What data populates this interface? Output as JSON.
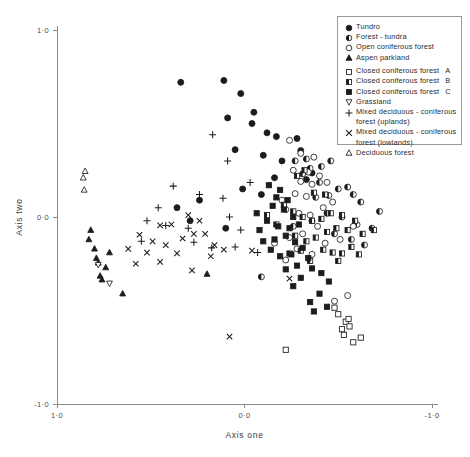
{
  "chart_data": {
    "type": "scatter",
    "title": "",
    "xlabel": "Axis one",
    "ylabel": "Axis two",
    "xlim": [
      1.0,
      -1.0
    ],
    "ylim": [
      -1.0,
      1.0
    ],
    "x_reversed": true,
    "grid": false,
    "legend_position": "top-right",
    "xticks": [
      {
        "value": 1.0,
        "label": "1·0"
      },
      {
        "value": 0.0,
        "label": "0·0"
      },
      {
        "value": -1.0,
        "label": "-1·0"
      }
    ],
    "yticks": [
      {
        "value": 1.0,
        "label": "1·0"
      },
      {
        "value": 0.0,
        "label": "0·0"
      },
      {
        "value": -1.0,
        "label": "-1·0"
      }
    ],
    "series": [
      {
        "name": "Tundra",
        "marker": "filled-circle",
        "points": [
          [
            0.34,
            0.72
          ],
          [
            0.11,
            0.73
          ],
          [
            0.02,
            0.66
          ],
          [
            -0.05,
            0.56
          ],
          [
            0.09,
            0.53
          ],
          [
            -0.04,
            0.5
          ],
          [
            -0.12,
            0.45
          ],
          [
            -0.17,
            0.43
          ],
          [
            -0.28,
            0.42
          ],
          [
            0.05,
            0.36
          ],
          [
            -0.1,
            0.33
          ],
          [
            -0.2,
            0.3
          ],
          [
            -0.3,
            0.355
          ],
          [
            -0.16,
            0.21
          ],
          [
            -0.33,
            0.2
          ],
          [
            0.01,
            0.15
          ],
          [
            -0.09,
            0.12
          ],
          [
            -0.36,
            0.235
          ],
          [
            0.24,
            0.09
          ],
          [
            0.29,
            -0.02
          ],
          [
            0.1,
            -0.06
          ],
          [
            0.36,
            0.05
          ]
        ]
      },
      {
        "name": "Forest - tundra",
        "marker": "half-circle",
        "points": [
          [
            -0.53,
            0.58
          ],
          [
            -0.65,
            0.46
          ],
          [
            -0.4,
            0.185
          ],
          [
            -0.22,
            0.04
          ],
          [
            -0.31,
            0.23
          ],
          [
            -0.35,
            0.26
          ],
          [
            -0.41,
            0.27
          ],
          [
            -0.46,
            0.3
          ],
          [
            -0.27,
            0.3
          ],
          [
            -0.33,
            0.31
          ],
          [
            -0.38,
            0.105
          ],
          [
            -0.45,
            0.115
          ],
          [
            -0.5,
            0.15
          ],
          [
            -0.55,
            0.16
          ],
          [
            -0.58,
            0.12
          ],
          [
            -0.62,
            0.08
          ],
          [
            -0.44,
            0.02
          ],
          [
            -0.52,
            0.0
          ],
          [
            -0.36,
            -0.02
          ],
          [
            -0.26,
            -0.05
          ],
          [
            -0.6,
            -0.04
          ],
          [
            -0.68,
            -0.06
          ],
          [
            -0.72,
            0.03
          ],
          [
            -0.48,
            -0.09
          ],
          [
            -0.57,
            -0.12
          ],
          [
            -0.09,
            -0.32
          ],
          [
            -0.64,
            -0.15
          ]
        ]
      },
      {
        "name": "Open coniferous forest",
        "marker": "open-circle",
        "points": [
          [
            -0.24,
            0.41
          ],
          [
            -0.3,
            0.34
          ],
          [
            -0.37,
            0.32
          ],
          [
            -0.26,
            0.25
          ],
          [
            -0.34,
            0.24
          ],
          [
            -0.4,
            0.22
          ],
          [
            -0.3,
            0.19
          ],
          [
            -0.36,
            0.175
          ],
          [
            -0.44,
            0.185
          ],
          [
            -0.27,
            0.125
          ],
          [
            -0.33,
            0.11
          ],
          [
            -0.2,
            0.09
          ],
          [
            -0.29,
            0.02
          ],
          [
            -0.35,
            0.01
          ],
          [
            -0.42,
            0.05
          ],
          [
            -0.47,
            0.08
          ],
          [
            -0.39,
            -0.05
          ],
          [
            -0.31,
            -0.09
          ],
          [
            -0.24,
            -0.11
          ],
          [
            -0.43,
            -0.14
          ],
          [
            -0.51,
            -0.12
          ],
          [
            -0.28,
            -0.17
          ],
          [
            -0.36,
            -0.2
          ],
          [
            -0.22,
            -0.23
          ],
          [
            -0.58,
            -0.05
          ],
          [
            -0.16,
            -0.14
          ],
          [
            -0.55,
            -0.42
          ],
          [
            -0.48,
            -0.45
          ]
        ]
      },
      {
        "name": "Aspen parkland",
        "marker": "filled-triangle",
        "points": [
          [
            0.82,
            -0.07
          ],
          [
            0.8,
            -0.17
          ],
          [
            0.79,
            -0.22
          ],
          [
            0.78,
            -0.245
          ],
          [
            0.72,
            -0.19
          ],
          [
            0.77,
            -0.315
          ],
          [
            0.76,
            -0.335
          ],
          [
            0.65,
            -0.41
          ],
          [
            0.83,
            -0.12
          ],
          [
            0.2,
            -0.305
          ],
          [
            0.74,
            -0.27
          ]
        ]
      },
      {
        "name": "Closed coniferous forest  A",
        "marker": "open-square",
        "points": [
          [
            -0.5,
            -0.52
          ],
          [
            -0.54,
            -0.56
          ],
          [
            -0.52,
            -0.6
          ],
          [
            -0.56,
            -0.585
          ],
          [
            -0.53,
            -0.63
          ],
          [
            -0.58,
            -0.67
          ],
          [
            -0.62,
            -0.645
          ],
          [
            -0.22,
            -0.71
          ],
          [
            -0.48,
            -0.485
          ],
          [
            -0.555,
            -0.545
          ]
        ]
      },
      {
        "name": "Closed coniferous forest  B",
        "marker": "half-square",
        "points": [
          [
            -0.32,
            0.25
          ],
          [
            -0.28,
            0.22
          ],
          [
            -0.37,
            0.13
          ],
          [
            -0.43,
            0.12
          ],
          [
            -0.21,
            0.065
          ],
          [
            -0.26,
            0.03
          ],
          [
            -0.31,
            0.0
          ],
          [
            -0.36,
            -0.02
          ],
          [
            -0.41,
            -0.01
          ],
          [
            -0.46,
            0.02
          ],
          [
            -0.52,
            0.01
          ],
          [
            -0.49,
            -0.06
          ],
          [
            -0.44,
            -0.08
          ],
          [
            -0.38,
            -0.11
          ],
          [
            -0.33,
            -0.13
          ],
          [
            -0.27,
            -0.1
          ],
          [
            -0.55,
            -0.07
          ],
          [
            -0.59,
            -0.02
          ],
          [
            -0.63,
            -0.09
          ],
          [
            -0.69,
            -0.07
          ],
          [
            -0.3,
            -0.18
          ],
          [
            -0.42,
            -0.175
          ],
          [
            -0.47,
            -0.19
          ],
          [
            -0.52,
            -0.195
          ],
          [
            -0.57,
            -0.16
          ],
          [
            -0.12,
            0.01
          ],
          [
            -0.17,
            -0.04
          ],
          [
            -0.24,
            -0.195
          ],
          [
            -0.35,
            -0.235
          ],
          [
            -0.5,
            -0.235
          ],
          [
            -0.61,
            -0.2
          ]
        ]
      },
      {
        "name": "Closed coniferous forest  C",
        "marker": "filled-square",
        "points": [
          [
            -0.13,
            0.17
          ],
          [
            -0.19,
            0.145
          ],
          [
            -0.17,
            0.105
          ],
          [
            -0.23,
            0.09
          ],
          [
            -0.15,
            0.06
          ],
          [
            -0.21,
            0.04
          ],
          [
            -0.26,
            0.0
          ],
          [
            -0.12,
            -0.02
          ],
          [
            -0.18,
            -0.05
          ],
          [
            -0.24,
            -0.06
          ],
          [
            -0.29,
            -0.04
          ],
          [
            -0.22,
            -0.1
          ],
          [
            -0.27,
            -0.135
          ],
          [
            -0.16,
            -0.12
          ],
          [
            -0.31,
            -0.165
          ],
          [
            -0.25,
            -0.2
          ],
          [
            -0.19,
            -0.21
          ],
          [
            -0.34,
            -0.22
          ],
          [
            -0.28,
            -0.26
          ],
          [
            -0.22,
            -0.28
          ],
          [
            -0.36,
            -0.275
          ],
          [
            -0.3,
            -0.325
          ],
          [
            -0.41,
            -0.3
          ],
          [
            -0.45,
            -0.345
          ],
          [
            -0.26,
            -0.37
          ],
          [
            -0.4,
            -0.41
          ],
          [
            -0.35,
            -0.455
          ],
          [
            -0.44,
            -0.48
          ],
          [
            -0.08,
            -0.07
          ],
          [
            -0.1,
            -0.13
          ],
          [
            -0.14,
            -0.175
          ],
          [
            -0.065,
            0.02
          ],
          [
            -0.37,
            -0.505
          ]
        ]
      },
      {
        "name": "Grassland",
        "marker": "open-down-triangle",
        "points": [
          [
            0.78,
            -0.255
          ],
          [
            0.72,
            -0.355
          ]
        ]
      },
      {
        "name": "Mixed  deciduous - coniferous forest (uplands)",
        "marker": "plus",
        "points": [
          [
            0.17,
            0.44
          ],
          [
            0.09,
            0.3
          ],
          [
            0.24,
            0.12
          ],
          [
            0.115,
            0.1
          ],
          [
            0.38,
            0.165
          ],
          [
            0.08,
            0.0
          ],
          [
            0.3,
            -0.06
          ],
          [
            0.42,
            -0.045
          ],
          [
            0.02,
            -0.07
          ],
          [
            -0.03,
            0.185
          ],
          [
            0.05,
            -0.16
          ],
          [
            0.175,
            -0.165
          ],
          [
            -0.07,
            -0.19
          ],
          [
            0.46,
            0.05
          ],
          [
            0.27,
            -0.135
          ],
          [
            0.52,
            -0.02
          ],
          [
            0.55,
            -0.13
          ]
        ]
      },
      {
        "name": "Mixed  deciduous - coniferous forest (lowlands)",
        "marker": "cross",
        "points": [
          [
            0.3,
            0.01
          ],
          [
            0.24,
            -0.02
          ],
          [
            0.39,
            -0.04
          ],
          [
            0.45,
            -0.045
          ],
          [
            0.27,
            -0.09
          ],
          [
            0.21,
            -0.09
          ],
          [
            0.33,
            -0.115
          ],
          [
            0.16,
            -0.15
          ],
          [
            0.42,
            -0.15
          ],
          [
            0.49,
            -0.13
          ],
          [
            0.52,
            -0.19
          ],
          [
            0.36,
            -0.195
          ],
          [
            0.56,
            -0.095
          ],
          [
            0.62,
            -0.17
          ],
          [
            0.58,
            -0.25
          ],
          [
            0.45,
            -0.24
          ],
          [
            0.18,
            -0.21
          ],
          [
            0.11,
            -0.175
          ],
          [
            -0.04,
            -0.18
          ],
          [
            -0.24,
            -0.33
          ],
          [
            0.08,
            -0.64
          ],
          [
            0.28,
            -0.285
          ]
        ]
      },
      {
        "name": "Deciduous forest",
        "marker": "open-up-triangle",
        "points": [
          [
            0.86,
            0.21
          ],
          [
            0.85,
            0.245
          ],
          [
            0.855,
            0.145
          ]
        ]
      }
    ]
  },
  "legend": {
    "entries": [
      {
        "marker": "filled-circle",
        "label": "Tundro",
        "suffix": "",
        "cont": null,
        "gap": false
      },
      {
        "marker": "half-circle",
        "label": "Forest - tundra",
        "suffix": "",
        "cont": null,
        "gap": false
      },
      {
        "marker": "open-circle",
        "label": "Open coniferous forest",
        "suffix": "",
        "cont": null,
        "gap": false
      },
      {
        "marker": "filled-triangle",
        "label": "Aspen parkland",
        "suffix": "",
        "cont": null,
        "gap": false
      },
      {
        "marker": "open-square",
        "label": "Closed coniferous forest",
        "suffix": "A",
        "cont": null,
        "gap": true
      },
      {
        "marker": "half-square",
        "label": "Closed coniferous forest",
        "suffix": "B",
        "cont": null,
        "gap": false
      },
      {
        "marker": "filled-square",
        "label": "Closed coniferous forest",
        "suffix": "C",
        "cont": null,
        "gap": false
      },
      {
        "marker": "open-down-triangle",
        "label": "Grassland",
        "suffix": "",
        "cont": null,
        "gap": false
      },
      {
        "marker": "plus",
        "label": "Mixed  deciduous - coniferous",
        "suffix": "",
        "cont": "forest (uplands)",
        "gap": false
      },
      {
        "marker": "cross",
        "label": "Mixed  deciduous - coniferous",
        "suffix": "",
        "cont": "forest (lowlands)",
        "gap": false
      },
      {
        "marker": "open-up-triangle",
        "label": "Deciduous forest",
        "suffix": "",
        "cont": null,
        "gap": false
      }
    ]
  },
  "colors": {
    "marker": "#1c1c1c",
    "axis": "#8a8a8a",
    "background": "#ffffff",
    "text": "#2b2b2b"
  }
}
